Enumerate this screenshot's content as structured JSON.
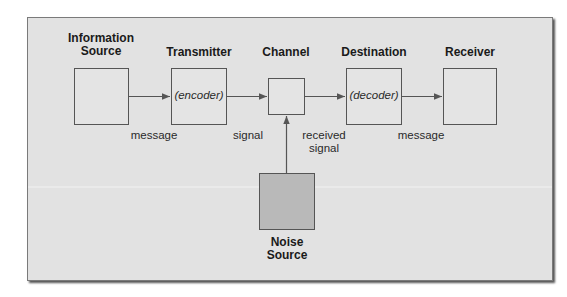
{
  "diagram": {
    "type": "communication-model",
    "colors": {
      "panel_bg": "#e2e2e2",
      "box_fill": "#e4e4e4",
      "noise_fill": "#b9b9b9",
      "stroke": "#555555",
      "text": "#1a1a1a"
    },
    "nodes": {
      "information_source": {
        "title_line1": "Information",
        "title_line2": "Source"
      },
      "transmitter": {
        "title": "Transmitter",
        "inner": "(encoder)"
      },
      "channel": {
        "title": "Channel"
      },
      "destination": {
        "title": "Destination",
        "inner": "(decoder)"
      },
      "receiver": {
        "title": "Receiver"
      },
      "noise_source": {
        "title_line1": "Noise",
        "title_line2": "Source"
      }
    },
    "edges": {
      "source_to_transmitter": {
        "label": "message"
      },
      "transmitter_to_channel": {
        "label": "signal"
      },
      "channel_to_destination": {
        "label_line1": "received",
        "label_line2": "signal"
      },
      "destination_to_receiver": {
        "label": "message"
      },
      "noise_to_channel": {
        "label": ""
      }
    }
  }
}
